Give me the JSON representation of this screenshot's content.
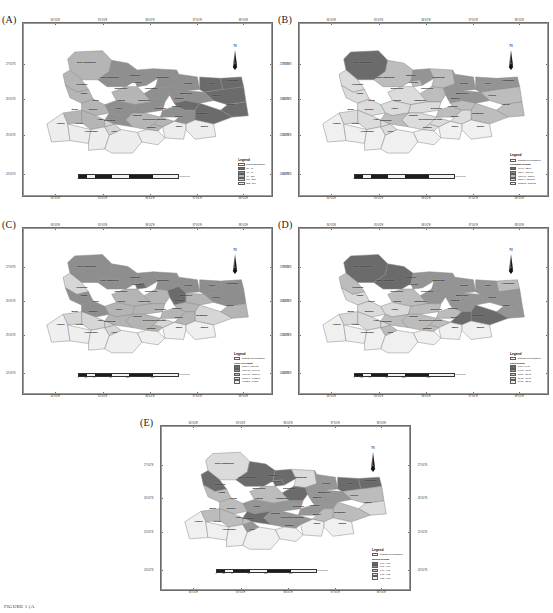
{
  "figure": {
    "caption": "FIGURE 1 (A",
    "region": "Bihar, India"
  },
  "chart_data": {
    "type": "map",
    "projection_axes": {
      "longitude_ticks": [
        "84°0'0\"E",
        "85°0'0\"E",
        "86°0'0\"E",
        "87°0'0\"E",
        "88°0'0\"E"
      ],
      "latitude_ticks": [
        "27°0'0\"N",
        "26°0'0\"N",
        "25°0'0\"N",
        "24°0'0\"N"
      ],
      "grid": false,
      "legend_position": "inside-bottom-right"
    },
    "scalebar": {
      "ticks": [
        "0",
        "20",
        "40",
        "80",
        "120",
        "160"
      ],
      "unit": "Kilometers"
    },
    "north_arrow_label": "N",
    "panels": [
      {
        "id": "A",
        "letter": "(A)",
        "legend_title": "Legend",
        "legend_subtitle": "",
        "boundary_label": "District Boundaries",
        "classes": [
          {
            "label": "37 - 40",
            "color": "#6b6b6b"
          },
          {
            "label": "41 - 48",
            "color": "#8f8f8f"
          },
          {
            "label": "49 - 118",
            "color": "#b5b5b5"
          },
          {
            "label": "119 - 262",
            "color": "#d4d4d4"
          },
          {
            "label": "263 - 800",
            "color": "#ededed"
          }
        ],
        "values": {
          "West Champaran": 2,
          "East Champaran": 1,
          "Sitamarhi": 1,
          "Madhubani": 1,
          "Supaul": 1,
          "Araria": 0,
          "Kishanganj": 0,
          "Purnea": 0,
          "Katihar": 0,
          "Madhepura": 1,
          "Saharsa": 1,
          "Darbhanga": 1,
          "Muzaffarpur": 2,
          "Sheohar": 1,
          "Gopalganj": 2,
          "Siwan": 2,
          "Saran": 2,
          "Vaishali": 1,
          "Samastipur": 1,
          "Begusarai": 1,
          "Khagaria": 0,
          "Bhagalpur": 0,
          "Munger": 1,
          "Banka": 4,
          "Jamui": 4,
          "Lakhisarai": 2,
          "Sheikhpura": 2,
          "Nalanda": 2,
          "Nawada": 4,
          "Patna": 1,
          "Bhojpur": 2,
          "Buxar": 2,
          "Kaimur": 4,
          "Rohtas": 4,
          "Aurangabad": 4,
          "Gaya": 4,
          "Jehanabad": 3,
          "Arwal": 3
        }
      },
      {
        "id": "B",
        "letter": "(B)",
        "legend_title": "Legend",
        "legend_subtitle": "Population Density",
        "boundary_label": "Districts not considered",
        "classes": [
          {
            "label": "764.3 - 820.5",
            "color": "#6b6b6b"
          },
          {
            "label": "820.6 - 1084.79",
            "color": "#949494"
          },
          {
            "label": "1084.79 - 1300.1",
            "color": "#bdbdbd"
          },
          {
            "label": "1300.1 - 1572.03",
            "color": "#dcdcdc"
          },
          {
            "label": "1572.03 - 1880.55",
            "color": "#f0f0f0"
          }
        ],
        "values": {
          "West Champaran": 0,
          "East Champaran": 2,
          "Sitamarhi": 1,
          "Madhubani": 2,
          "Supaul": 1,
          "Araria": 1,
          "Kishanganj": 1,
          "Purnea": 2,
          "Katihar": 2,
          "Madhepura": 1,
          "Saharsa": 1,
          "Darbhanga": 2,
          "Muzaffarpur": 3,
          "Sheohar": 2,
          "Gopalganj": 3,
          "Siwan": 3,
          "Saran": 3,
          "Vaishali": 3,
          "Samastipur": 3,
          "Begusarai": 2,
          "Khagaria": 2,
          "Bhagalpur": 2,
          "Munger": 3,
          "Banka": 4,
          "Jamui": 4,
          "Lakhisarai": 3,
          "Sheikhpura": 3,
          "Nalanda": 3,
          "Nawada": 4,
          "Patna": 2,
          "Bhojpur": 3,
          "Buxar": 3,
          "Kaimur": 4,
          "Rohtas": 4,
          "Aurangabad": 4,
          "Gaya": 4,
          "Jehanabad": 3,
          "Arwal": 3
        }
      },
      {
        "id": "C",
        "letter": "(C)",
        "legend_title": "Legend",
        "legend_subtitle": "GSDP Per Capita",
        "boundary_label": "Districts not considered",
        "classes": [
          {
            "label": "8936.1 - 8954.05",
            "color": "#6b6b6b"
          },
          {
            "label": "8954.05 - 9640.76",
            "color": "#8e8e8e"
          },
          {
            "label": "9640.76 - 11071.1",
            "color": "#b4b4b4"
          },
          {
            "label": "11071.1 - 14022.3",
            "color": "#d6d6d6"
          },
          {
            "label": "14022.3 - 19063",
            "color": "#efefef"
          }
        ],
        "values": {
          "West Champaran": 1,
          "East Champaran": 1,
          "Sitamarhi": 1,
          "Madhubani": 1,
          "Supaul": 1,
          "Araria": 1,
          "Kishanganj": 1,
          "Purnea": 1,
          "Katihar": 2,
          "Madhepura": 2,
          "Saharsa": 0,
          "Darbhanga": 2,
          "Muzaffarpur": 2,
          "Sheohar": 0,
          "Gopalganj": 3,
          "Siwan": 1,
          "Saran": 1,
          "Vaishali": 2,
          "Samastipur": 2,
          "Begusarai": 2,
          "Khagaria": 2,
          "Bhagalpur": 3,
          "Munger": 2,
          "Banka": 4,
          "Jamui": 4,
          "Lakhisarai": 3,
          "Sheikhpura": 2,
          "Nalanda": 2,
          "Nawada": 4,
          "Patna": 2,
          "Bhojpur": 3,
          "Buxar": 3,
          "Kaimur": 4,
          "Rohtas": 4,
          "Aurangabad": 4,
          "Gaya": 4,
          "Jehanabad": 3,
          "Arwal": 3
        }
      },
      {
        "id": "D",
        "letter": "(D)",
        "legend_title": "Legend",
        "legend_subtitle": "Road Density",
        "boundary_label": "Districts not considered",
        "classes": [
          {
            "label": "5.05 - 14.61",
            "color": "#6b6b6b"
          },
          {
            "label": "14.61 - 18.59",
            "color": "#949494"
          },
          {
            "label": "18.59 - 21.08",
            "color": "#bcbcbc"
          },
          {
            "label": "21.08 - 24.59",
            "color": "#dadada"
          },
          {
            "label": "24.59 - 32.08",
            "color": "#f0f0f0"
          }
        ],
        "values": {
          "West Champaran": 0,
          "East Champaran": 0,
          "Sitamarhi": 1,
          "Madhubani": 1,
          "Supaul": 1,
          "Araria": 1,
          "Kishanganj": 2,
          "Purnea": 1,
          "Katihar": 1,
          "Madhepura": 1,
          "Saharsa": 1,
          "Darbhanga": 1,
          "Muzaffarpur": 2,
          "Sheohar": 1,
          "Gopalganj": 2,
          "Siwan": 3,
          "Saran": 3,
          "Vaishali": 3,
          "Samastipur": 2,
          "Begusarai": 2,
          "Khagaria": 1,
          "Bhagalpur": 0,
          "Munger": 0,
          "Banka": 4,
          "Jamui": 4,
          "Lakhisarai": 2,
          "Sheikhpura": 2,
          "Nalanda": 2,
          "Nawada": 4,
          "Patna": 2,
          "Bhojpur": 3,
          "Buxar": 3,
          "Kaimur": 4,
          "Rohtas": 4,
          "Aurangabad": 4,
          "Gaya": 4,
          "Jehanabad": 2,
          "Arwal": 3
        }
      },
      {
        "id": "E",
        "letter": "(E)",
        "legend_title": "Legend",
        "legend_subtitle": "Medical Density",
        "boundary_label": "Districts not considered",
        "classes": [
          {
            "label": "0.68 - 0.89",
            "color": "#6b6b6b"
          },
          {
            "label": "0.89 - 0.99",
            "color": "#969696"
          },
          {
            "label": "0.99 - 1.11",
            "color": "#bcbcbc"
          },
          {
            "label": "1.11 - 1.35",
            "color": "#dbdbdb"
          },
          {
            "label": "1.35 - 1.86",
            "color": "#f0f0f0"
          }
        ],
        "values": {
          "West Champaran": 3,
          "East Champaran": 0,
          "Sitamarhi": 0,
          "Madhubani": 3,
          "Supaul": 1,
          "Araria": 0,
          "Kishanganj": 0,
          "Purnea": 2,
          "Katihar": 3,
          "Madhepura": 1,
          "Saharsa": 1,
          "Darbhanga": 0,
          "Muzaffarpur": 2,
          "Sheohar": 0,
          "Gopalganj": 0,
          "Siwan": 2,
          "Saran": 2,
          "Vaishali": 1,
          "Samastipur": 1,
          "Begusarai": 1,
          "Khagaria": 1,
          "Bhagalpur": 2,
          "Munger": 2,
          "Banka": 4,
          "Jamui": 4,
          "Lakhisarai": 1,
          "Sheikhpura": 1,
          "Nalanda": 1,
          "Nawada": 4,
          "Patna": 0,
          "Bhojpur": 2,
          "Buxar": 2,
          "Kaimur": 4,
          "Rohtas": 4,
          "Aurangabad": 4,
          "Gaya": 4,
          "Jehanabad": 1,
          "Arwal": 2
        }
      }
    ],
    "districts": [
      {
        "name": "West Champaran",
        "x": 23,
        "y": 14
      },
      {
        "name": "East Champaran",
        "x": 33,
        "y": 25
      },
      {
        "name": "Sitamarhi",
        "x": 44,
        "y": 23
      },
      {
        "name": "Sheohar",
        "x": 45,
        "y": 28
      },
      {
        "name": "Madhubani",
        "x": 56,
        "y": 25
      },
      {
        "name": "Supaul",
        "x": 67,
        "y": 29
      },
      {
        "name": "Araria",
        "x": 77,
        "y": 29
      },
      {
        "name": "Kishanganj",
        "x": 86,
        "y": 27
      },
      {
        "name": "Purnea",
        "x": 79,
        "y": 38
      },
      {
        "name": "Katihar",
        "x": 85,
        "y": 44
      },
      {
        "name": "Madhepura",
        "x": 66,
        "y": 36
      },
      {
        "name": "Saharsa",
        "x": 63,
        "y": 40
      },
      {
        "name": "Darbhanga",
        "x": 51,
        "y": 33
      },
      {
        "name": "Muzaffarpur",
        "x": 38,
        "y": 33
      },
      {
        "name": "Gopalganj",
        "x": 21,
        "y": 30
      },
      {
        "name": "Siwan",
        "x": 22,
        "y": 36
      },
      {
        "name": "Saran",
        "x": 27,
        "y": 41
      },
      {
        "name": "Vaishali",
        "x": 38,
        "y": 41
      },
      {
        "name": "Samastipur",
        "x": 48,
        "y": 41
      },
      {
        "name": "Begusarai",
        "x": 55,
        "y": 47
      },
      {
        "name": "Khagaria",
        "x": 62,
        "y": 46
      },
      {
        "name": "Bhagalpur",
        "x": 73,
        "y": 51
      },
      {
        "name": "Munger",
        "x": 63,
        "y": 53
      },
      {
        "name": "Banka",
        "x": 74,
        "y": 60
      },
      {
        "name": "Jamui",
        "x": 63,
        "y": 60
      },
      {
        "name": "Lakhisarai",
        "x": 55,
        "y": 55
      },
      {
        "name": "Sheikhpura",
        "x": 50,
        "y": 55
      },
      {
        "name": "Nalanda",
        "x": 45,
        "y": 52
      },
      {
        "name": "Nawada",
        "x": 51,
        "y": 61
      },
      {
        "name": "Patna",
        "x": 37,
        "y": 47
      },
      {
        "name": "Bhojpur",
        "x": 26,
        "y": 48
      },
      {
        "name": "Buxar",
        "x": 18,
        "y": 48
      },
      {
        "name": "Kaimur",
        "x": 12,
        "y": 58
      },
      {
        "name": "Rohtas",
        "x": 20,
        "y": 58
      },
      {
        "name": "Aurangabad",
        "x": 25,
        "y": 64
      },
      {
        "name": "Gaya",
        "x": 35,
        "y": 64
      },
      {
        "name": "Jehanabad",
        "x": 33,
        "y": 56
      },
      {
        "name": "Arwal",
        "x": 29,
        "y": 55
      }
    ]
  }
}
